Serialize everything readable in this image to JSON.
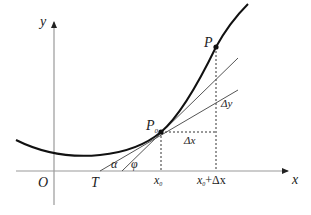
{
  "diagram": {
    "axes": {
      "x_label": "x",
      "y_label": "y",
      "origin_label": "O"
    },
    "points": {
      "p0_label": "P",
      "p0_subscript": "0",
      "p_label": "P",
      "t_label": "T"
    },
    "x_ticks": {
      "x0_label": "x",
      "x0_subscript": "0",
      "x0_plus_dx_label": "x",
      "x0_plus_dx_subscript": "0",
      "x0_plus_dx_suffix": "+Δx"
    },
    "increments": {
      "dx_label": "Δx",
      "dy_label": "Δy"
    },
    "angles": {
      "alpha_label": "α",
      "phi_label": "φ"
    },
    "colors": {
      "axis": "#888888",
      "curve": "#111111",
      "lines": "#555555",
      "dashed": "#333333",
      "text": "#222222"
    }
  }
}
